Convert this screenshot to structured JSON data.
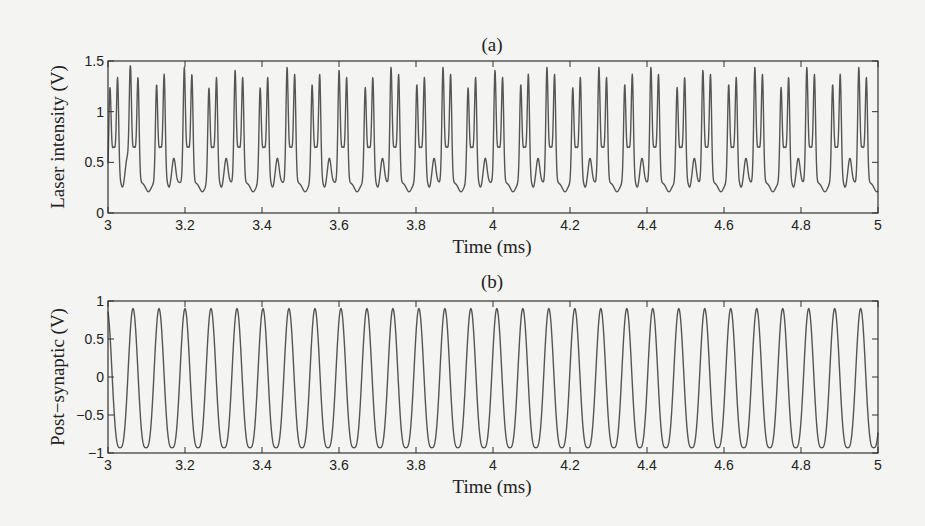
{
  "chart_data": [
    {
      "type": "line",
      "panel": "a",
      "title": "(a)",
      "xlabel": "Time (ms)",
      "ylabel": "Laser intensity (V)",
      "xlim": [
        3,
        5
      ],
      "ylim": [
        0,
        1.5
      ],
      "xticks": [
        3,
        3.2,
        3.4,
        3.6,
        3.8,
        4,
        4.2,
        4.4,
        4.6,
        4.8,
        5
      ],
      "xtick_labels": [
        "3",
        "3.2",
        "3.4",
        "3.6",
        "3.8",
        "4",
        "4.2",
        "4.4",
        "4.6",
        "4.8",
        "5"
      ],
      "yticks": [
        0,
        0.5,
        1,
        1.5
      ],
      "ytick_labels": [
        "0",
        "0.5",
        "1",
        "1.5"
      ],
      "grid": false,
      "description": "Spike-pair pulse train; each pulse is two sharp spikes ~0.02 ms apart, pulses every ~0.0675 ms, baseline ~0.3 V, alternating small bump (~0.55 V) or dip (~0.2 V) between pulses",
      "baseline": 0.3,
      "pulse_period_ms": 0.0675,
      "pulses": [
        {
          "t": 3.005,
          "h1": 1.15,
          "h2": 1.25,
          "after": "bump"
        },
        {
          "t": 3.058,
          "h1": 1.35,
          "h2": 1.25,
          "after": "dip"
        },
        {
          "t": 3.126,
          "h1": 1.18,
          "h2": 1.28,
          "after": "bump"
        },
        {
          "t": 3.198,
          "h1": 1.35,
          "h2": 1.28,
          "after": "dip"
        },
        {
          "t": 3.262,
          "h1": 1.15,
          "h2": 1.25,
          "after": "bump"
        },
        {
          "t": 3.33,
          "h1": 1.32,
          "h2": 1.25,
          "after": "dip"
        },
        {
          "t": 3.395,
          "h1": 1.15,
          "h2": 1.25,
          "after": "bump"
        },
        {
          "t": 3.465,
          "h1": 1.35,
          "h2": 1.28,
          "after": "dip"
        },
        {
          "t": 3.53,
          "h1": 1.18,
          "h2": 1.28,
          "after": "bump"
        },
        {
          "t": 3.6,
          "h1": 1.32,
          "h2": 1.25,
          "after": "dip"
        },
        {
          "t": 3.668,
          "h1": 1.15,
          "h2": 1.25,
          "after": "bump"
        },
        {
          "t": 3.735,
          "h1": 1.35,
          "h2": 1.28,
          "after": "dip"
        },
        {
          "t": 3.802,
          "h1": 1.18,
          "h2": 1.25,
          "after": "bump"
        },
        {
          "t": 3.87,
          "h1": 1.35,
          "h2": 1.28,
          "after": "dip"
        },
        {
          "t": 3.935,
          "h1": 1.15,
          "h2": 1.25,
          "after": "bump"
        },
        {
          "t": 4.005,
          "h1": 1.32,
          "h2": 1.25,
          "after": "dip"
        },
        {
          "t": 4.072,
          "h1": 1.18,
          "h2": 1.28,
          "after": "bump"
        },
        {
          "t": 4.14,
          "h1": 1.35,
          "h2": 1.28,
          "after": "dip"
        },
        {
          "t": 4.207,
          "h1": 1.15,
          "h2": 1.25,
          "after": "bump"
        },
        {
          "t": 4.275,
          "h1": 1.35,
          "h2": 1.25,
          "after": "dip"
        },
        {
          "t": 4.342,
          "h1": 1.18,
          "h2": 1.28,
          "after": "bump"
        },
        {
          "t": 4.41,
          "h1": 1.35,
          "h2": 1.28,
          "after": "dip"
        },
        {
          "t": 4.478,
          "h1": 1.15,
          "h2": 1.25,
          "after": "bump"
        },
        {
          "t": 4.545,
          "h1": 1.32,
          "h2": 1.28,
          "after": "dip"
        },
        {
          "t": 4.612,
          "h1": 1.18,
          "h2": 1.25,
          "after": "bump"
        },
        {
          "t": 4.68,
          "h1": 1.35,
          "h2": 1.28,
          "after": "dip"
        },
        {
          "t": 4.748,
          "h1": 1.15,
          "h2": 1.25,
          "after": "bump"
        },
        {
          "t": 4.815,
          "h1": 1.35,
          "h2": 1.28,
          "after": "dip"
        },
        {
          "t": 4.882,
          "h1": 1.18,
          "h2": 1.28,
          "after": "bump"
        },
        {
          "t": 4.95,
          "h1": 1.35,
          "h2": 1.25,
          "after": "dip"
        }
      ]
    },
    {
      "type": "line",
      "panel": "b",
      "title": "(b)",
      "xlabel": "Time (ms)",
      "ylabel": "Post−synaptic (V)",
      "xlim": [
        3,
        5
      ],
      "ylim": [
        -1,
        1
      ],
      "xticks": [
        3,
        3.2,
        3.4,
        3.6,
        3.8,
        4,
        4.2,
        4.4,
        4.6,
        4.8,
        5
      ],
      "xtick_labels": [
        "3",
        "3.2",
        "3.4",
        "3.6",
        "3.8",
        "4",
        "4.2",
        "4.4",
        "4.6",
        "4.8",
        "5"
      ],
      "yticks": [
        -1,
        -0.5,
        0,
        0.5,
        1
      ],
      "ytick_labels": [
        "−1",
        "−0.5",
        "0",
        "0.5",
        "1"
      ],
      "grid": false,
      "description": "Periodic oscillation with narrow peaks at ~0.9 V and broad troughs at ~-0.93 V",
      "peak_value": 0.9,
      "trough_value": -0.93,
      "period_ms": 0.0675,
      "first_peak_ms": 3.065,
      "peak_times_ms": [
        3.065,
        3.133,
        3.2,
        3.268,
        3.335,
        3.403,
        3.47,
        3.538,
        3.605,
        3.673,
        3.741,
        3.808,
        3.876,
        3.943,
        4.011,
        4.078,
        4.146,
        4.213,
        4.281,
        4.348,
        4.416,
        4.483,
        4.551,
        4.618,
        4.686,
        4.753,
        4.821,
        4.889,
        4.956
      ]
    }
  ]
}
